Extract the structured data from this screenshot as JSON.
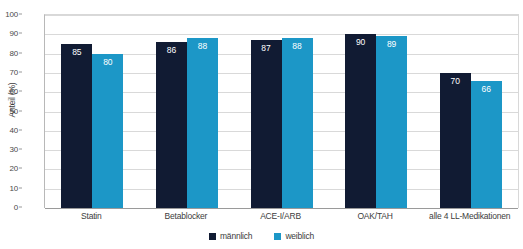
{
  "chart_data": {
    "type": "bar",
    "title": "",
    "subtitle": "",
    "xlabel": "",
    "ylabel": "Anteil (%)",
    "ylim": [
      0,
      100
    ],
    "ytick_step": 10,
    "yticks": [
      0,
      10,
      20,
      30,
      40,
      50,
      60,
      70,
      80,
      90,
      100
    ],
    "grid": true,
    "legend_position": "bottom-center",
    "categories": [
      "Statin",
      "Betablocker",
      "ACE-I/ARB",
      "OAK/TAH",
      "alle 4 LL-Medikationen"
    ],
    "series": [
      {
        "name": "männlich",
        "color": "#111b33",
        "values": [
          85,
          86,
          87,
          90,
          70
        ],
        "labels": [
          "85",
          "86",
          "87",
          "90",
          "70"
        ]
      },
      {
        "name": "weiblich",
        "color": "#1c97c7",
        "values": [
          80,
          88,
          88,
          89,
          66
        ],
        "labels": [
          "80",
          "88",
          "88",
          "89",
          "66"
        ]
      }
    ],
    "data_label_color": "#ffffff"
  },
  "axis": {
    "y_title": "Anteil (%)",
    "y_tick_labels": [
      "100",
      "90",
      "80",
      "70",
      "60",
      "50",
      "40",
      "30",
      "20",
      "10",
      "0"
    ],
    "x_tick_labels": [
      "Statin",
      "Betablocker",
      "ACE-I/ARB",
      "OAK/TAH",
      "alle 4 LL-Medikationen"
    ]
  },
  "legend": {
    "items": [
      {
        "label": "männlich",
        "color": "#111b33"
      },
      {
        "label": "weiblich",
        "color": "#1c97c7"
      }
    ]
  },
  "colors": {
    "male": "#111b33",
    "female": "#1c97c7",
    "grid": "#d9d9d9",
    "axis": "#9a9a9a",
    "text": "#3c3c3c",
    "background": "#ffffff"
  }
}
